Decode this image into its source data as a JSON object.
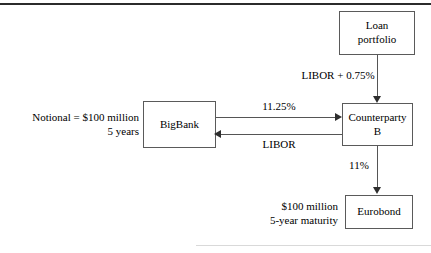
{
  "diagram": {
    "nodes": [
      {
        "id": "loan-portfolio",
        "label": "Loan\nportfolio"
      },
      {
        "id": "bigbank",
        "label": "BigBank"
      },
      {
        "id": "counterparty-b",
        "label": "Counterparty\nB"
      },
      {
        "id": "eurobond",
        "label": "Eurobond"
      }
    ],
    "edge_labels": {
      "loan_rate": "LIBOR + 0.75%",
      "fixed_rate": "11.25%",
      "floating_rate": "LIBOR",
      "eurobond_rate": "11%"
    },
    "annotations": {
      "notional": "Notional = $100 million\n5 years",
      "eurobond_terms": "$100 million\n5-year maturity"
    },
    "colors": {
      "box_border": "#5a5a5a",
      "connector": "#555555",
      "arrowhead": "#2e2e2e",
      "text": "#000000",
      "rule_top": "#2b2b2b",
      "rule_bottom": "#d9d9d9",
      "background": "#ffffff"
    }
  }
}
